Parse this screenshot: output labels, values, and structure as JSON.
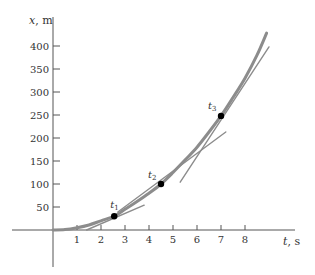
{
  "chart_data": {
    "type": "line",
    "title": "",
    "xlabel": "t, s",
    "ylabel": "x, m",
    "xlabel_var": "t",
    "xlabel_unit": ", s",
    "ylabel_var": "x",
    "ylabel_unit": ", m",
    "xlim": [
      -1.7,
      10.1
    ],
    "ylim": [
      -80,
      460
    ],
    "grid": false,
    "legend": null,
    "x_ticks": [
      1,
      2,
      3,
      4,
      5,
      6,
      7,
      8
    ],
    "y_ticks": [
      50,
      100,
      150,
      200,
      250,
      300,
      350,
      400
    ],
    "series": [
      {
        "name": "position curve",
        "kind": "curve",
        "color": "#8c8c8c",
        "width": 3,
        "x": [
          0,
          0.5,
          1,
          1.5,
          2,
          2.55,
          3,
          3.5,
          4,
          4.5,
          5,
          5.5,
          6,
          6.5,
          7,
          7.5,
          8,
          8.5,
          8.9
        ],
        "y": [
          0,
          1,
          5,
          11,
          20,
          30,
          45,
          62,
          80,
          100,
          125,
          152,
          180,
          213,
          248,
          288,
          330,
          380,
          428
        ]
      },
      {
        "name": "tangent at t1",
        "kind": "line",
        "color": "#8c8c8c",
        "width": 1.4,
        "x": [
          1.4,
          3.8
        ],
        "y": [
          0,
          54
        ]
      },
      {
        "name": "tangent at t2",
        "kind": "line",
        "color": "#8c8c8c",
        "width": 1.4,
        "x": [
          2.7,
          7.2
        ],
        "y": [
          39,
          213
        ]
      },
      {
        "name": "tangent at t3",
        "kind": "line",
        "color": "#8c8c8c",
        "width": 1.4,
        "x": [
          5.3,
          9.0
        ],
        "y": [
          104,
          398
        ]
      }
    ],
    "points": [
      {
        "label": "t",
        "sub": "1",
        "t": 2.55,
        "x": 30,
        "label_dx": -4,
        "label_dy": -8
      },
      {
        "label": "t",
        "sub": "2",
        "t": 4.5,
        "x": 100,
        "label_dx": -13,
        "label_dy": -6
      },
      {
        "label": "t",
        "sub": "3",
        "t": 7.0,
        "x": 248,
        "label_dx": -13,
        "label_dy": -7
      }
    ],
    "annotations": [
      "t1",
      "t2",
      "t3"
    ]
  },
  "layout": {
    "origin_px": [
      53,
      230
    ],
    "px_per_t": 24,
    "px_per_x": 0.46,
    "x_axis_px": [
      12,
      295
    ],
    "y_axis_px": [
      17,
      267
    ],
    "axis_color": "#555555",
    "point_color": "#000000"
  }
}
